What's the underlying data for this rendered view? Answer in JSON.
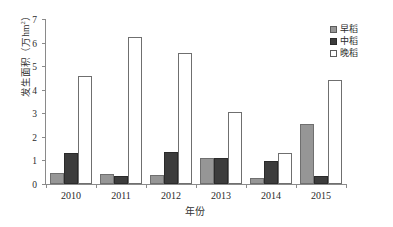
{
  "chart_data": {
    "type": "bar",
    "title": "",
    "xlabel": "年份",
    "ylabel": "发生面积（万hm²）",
    "ylabel_text": "发生面积（万hm",
    "ylabel_sup": "2",
    "ylabel_tail": "）",
    "categories": [
      "2010",
      "2011",
      "2012",
      "2013",
      "2014",
      "2015"
    ],
    "series": [
      {
        "name": "早稻",
        "color": "#969696",
        "values": [
          0.48,
          0.43,
          0.4,
          1.12,
          0.27,
          2.54
        ]
      },
      {
        "name": "中稻",
        "color": "#3c3c3c",
        "values": [
          1.3,
          0.36,
          1.34,
          1.11,
          0.97,
          0.32
        ]
      },
      {
        "name": "晚稻",
        "color": "#ffffff",
        "values": [
          4.58,
          6.25,
          5.57,
          3.06,
          1.33,
          4.42
        ]
      }
    ],
    "ylim": [
      0,
      7
    ],
    "yticks": [
      0,
      1,
      2,
      3,
      4,
      5,
      6,
      7
    ],
    "ytick_labels": [
      "0",
      "1",
      "2",
      "3",
      "4",
      "5",
      "6",
      "7"
    ],
    "grid": false,
    "legend_position": "top-right"
  },
  "legend": {
    "items": [
      {
        "label": "早稻"
      },
      {
        "label": "中稻"
      },
      {
        "label": "晚稻"
      }
    ]
  },
  "axes": {
    "x_title": "年份",
    "y_title": "发生面积（万hm²）"
  }
}
